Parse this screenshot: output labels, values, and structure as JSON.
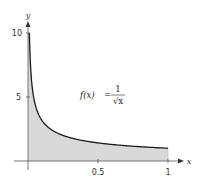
{
  "chart_data": {
    "type": "area",
    "title": "",
    "function_label": "f(x) = 1/√x",
    "function_label_parts": {
      "lhs": "f(x)",
      "eq": "=",
      "num": "1",
      "den": "√x"
    },
    "xlabel": "x",
    "ylabel": "y",
    "xlim": [
      0,
      1
    ],
    "ylim": [
      0,
      10
    ],
    "x_ticks": [
      0.5,
      1
    ],
    "x_tick_labels": [
      "0.5",
      "1"
    ],
    "y_ticks": [
      5,
      10
    ],
    "y_tick_labels": [
      "5",
      "10"
    ],
    "grid": false,
    "legend": null,
    "shaded_region": {
      "from_x": 0,
      "to_x": 1,
      "under": "f(x)",
      "fill": "#d9d9d9"
    },
    "series": [
      {
        "name": "f(x) = 1/sqrt(x)",
        "x": [
          0.01,
          0.02,
          0.03,
          0.05,
          0.075,
          0.1,
          0.15,
          0.2,
          0.3,
          0.4,
          0.5,
          0.6,
          0.7,
          0.8,
          0.9,
          1.0
        ],
        "y": [
          10,
          7.07,
          5.77,
          4.47,
          3.65,
          3.16,
          2.58,
          2.24,
          1.83,
          1.58,
          1.41,
          1.29,
          1.2,
          1.12,
          1.05,
          1.0
        ]
      }
    ],
    "colors": {
      "curve": "#1a1a1a",
      "fill": "#d9d9d9",
      "axis": "#444444"
    }
  }
}
